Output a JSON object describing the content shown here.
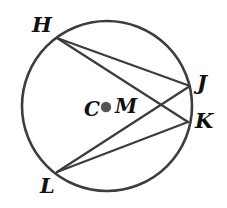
{
  "figure": {
    "kind": "circle-with-inscribed-chords",
    "background_color": "#ffffff",
    "stroke_color": "#3d3d3d",
    "center_dot_color": "#555555",
    "label_color": "#111111",
    "width": 227,
    "height": 208
  },
  "circle": {
    "name": "circle-C",
    "center_x": 107,
    "center_y": 106,
    "radius": 85,
    "stroke_width": 2.6
  },
  "center_marker": {
    "dot_x": 106,
    "dot_y": 107,
    "dot_radius": 5.2,
    "left_label": "C",
    "right_label": "M"
  },
  "points": [
    {
      "id": "H",
      "label": "H",
      "x": 57,
      "y": 38,
      "label_x": 32,
      "label_y": 14
    },
    {
      "id": "J",
      "label": "J",
      "x": 190,
      "y": 86,
      "label_x": 197,
      "label_y": 72
    },
    {
      "id": "K",
      "label": "K",
      "x": 188,
      "y": 122,
      "label_x": 195,
      "label_y": 110
    },
    {
      "id": "L",
      "label": "L",
      "x": 57,
      "y": 172,
      "label_x": 40,
      "label_y": 175
    }
  ],
  "chords": [
    {
      "id": "HJ",
      "from": "H",
      "to": "J",
      "x1": 57,
      "y1": 38,
      "x2": 190,
      "y2": 86
    },
    {
      "id": "HK",
      "from": "H",
      "to": "K",
      "x1": 57,
      "y1": 38,
      "x2": 188,
      "y2": 122
    },
    {
      "id": "LJ",
      "from": "L",
      "to": "J",
      "x1": 57,
      "y1": 172,
      "x2": 190,
      "y2": 86
    },
    {
      "id": "LK",
      "from": "L",
      "to": "K",
      "x1": 57,
      "y1": 172,
      "x2": 188,
      "y2": 122
    }
  ],
  "intersection": {
    "id": "HK-x-LJ",
    "x": 163,
    "y": 105
  }
}
